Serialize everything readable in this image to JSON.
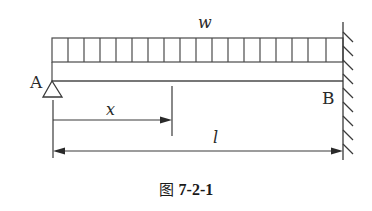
{
  "figure": {
    "caption_prefix": "图",
    "caption_number": "7-2-1",
    "load_label": "w",
    "left_support_label": "A",
    "right_support_label": "B",
    "position_label": "x",
    "length_label": "l"
  },
  "components": {
    "beam": "horizontal beam from A to B",
    "load": "uniformly distributed load w over full span",
    "left_support": "pin (triangle) support at A",
    "right_support": "fixed wall support at B",
    "dimensions": [
      "x: distance from A to section",
      "l: total span length A to B"
    ]
  },
  "colors": {
    "line": "#3a3a3a",
    "background": "#ffffff"
  }
}
